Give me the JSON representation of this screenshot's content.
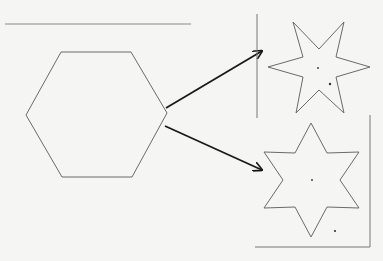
{
  "diagram": {
    "colors": {
      "background": "#f5f5f3",
      "shape_stroke": "#6a6a6a",
      "arrow": "#1a1a1a",
      "frame": "#777777"
    },
    "shapes": [
      {
        "id": "hexagon",
        "type": "hexagon"
      },
      {
        "id": "star-top",
        "type": "six-pointed-star",
        "rotation": "pointing sideways"
      },
      {
        "id": "star-bottom",
        "type": "six-pointed-star",
        "rotation": "pointing up/down"
      }
    ],
    "arrows": [
      {
        "from": "hexagon",
        "to": "star-top"
      },
      {
        "from": "hexagon",
        "to": "star-bottom"
      }
    ]
  }
}
